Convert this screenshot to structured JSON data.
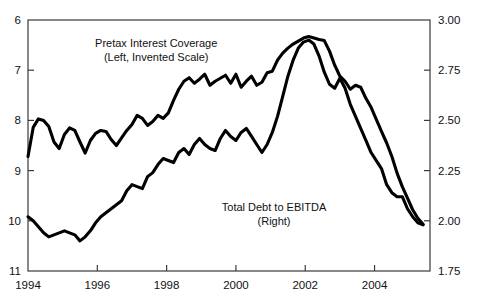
{
  "chart_data": {
    "type": "line",
    "title": "",
    "subtitle": "",
    "xlabel": "",
    "ylabel": "",
    "grid": false,
    "legend_position": "inline-annotations",
    "xlim": [
      1994.0,
      2005.6
    ],
    "x_ticks": [
      1994,
      1996,
      1998,
      2000,
      2002,
      2004
    ],
    "x_tick_labels": [
      "1994",
      "1996",
      "1998",
      "2000",
      "2002",
      "2004"
    ],
    "left_axis": {
      "label": "Pretax Interest Coverage (Left, Invented Scale)",
      "ylim": [
        11,
        6
      ],
      "inverted": true,
      "ticks": [
        6,
        7,
        8,
        9,
        10,
        11
      ],
      "tick_labels": [
        "6",
        "7",
        "8",
        "9",
        "10",
        "11"
      ]
    },
    "right_axis": {
      "label": "Total Debt to EBITDA (Right)",
      "ylim": [
        1.75,
        3.0
      ],
      "inverted": false,
      "ticks": [
        1.75,
        2.0,
        2.25,
        2.5,
        2.75,
        3.0
      ],
      "tick_labels": [
        "1.75",
        "2.00",
        "2.25",
        "2.50",
        "2.75",
        "3.00"
      ]
    },
    "annotations": [
      {
        "name": "pretax-interest-coverage-label",
        "lines": [
          "Pretax Interest Coverage",
          "(Left, Invented Scale)"
        ],
        "x": 1997.7,
        "y_px": 47
      },
      {
        "name": "total-debt-to-ebitda-label",
        "lines": [
          "Total Debt to EBITDA",
          "(Right)"
        ],
        "x": 2001.1,
        "y_px": 211
      }
    ],
    "series": [
      {
        "name": "Pretax Interest Coverage",
        "axis": "left",
        "color": "#000000",
        "x": [
          1994.0,
          1994.15,
          1994.3,
          1994.45,
          1994.6,
          1994.75,
          1994.9,
          1995.05,
          1995.2,
          1995.35,
          1995.5,
          1995.65,
          1995.8,
          1995.95,
          1996.1,
          1996.25,
          1996.4,
          1996.55,
          1996.7,
          1996.85,
          1997.0,
          1997.15,
          1997.3,
          1997.45,
          1997.6,
          1997.75,
          1997.9,
          1998.05,
          1998.2,
          1998.35,
          1998.5,
          1998.65,
          1998.8,
          1998.95,
          1999.1,
          1999.25,
          1999.4,
          1999.55,
          1999.7,
          1999.85,
          2000.0,
          2000.15,
          2000.3,
          2000.45,
          2000.6,
          2000.75,
          2000.9,
          2001.05,
          2001.2,
          2001.35,
          2001.5,
          2001.65,
          2001.8,
          2001.95,
          2002.1,
          2002.25,
          2002.4,
          2002.55,
          2002.7,
          2002.85,
          2003.0,
          2003.15,
          2003.3,
          2003.45,
          2003.6,
          2003.75,
          2003.9,
          2004.05,
          2004.2,
          2004.35,
          2004.5,
          2004.65,
          2004.8,
          2004.95,
          2005.1,
          2005.25,
          2005.4
        ],
        "y": [
          8.72,
          8.14,
          7.97,
          8.0,
          8.12,
          8.43,
          8.56,
          8.28,
          8.15,
          8.2,
          8.43,
          8.65,
          8.4,
          8.26,
          8.2,
          8.22,
          8.38,
          8.5,
          8.35,
          8.2,
          8.08,
          7.9,
          7.96,
          8.1,
          8.02,
          7.9,
          7.96,
          7.85,
          7.6,
          7.38,
          7.22,
          7.15,
          7.26,
          7.18,
          7.08,
          7.3,
          7.22,
          7.16,
          7.1,
          7.26,
          7.08,
          7.34,
          7.22,
          7.12,
          7.3,
          7.24,
          7.05,
          7.02,
          6.8,
          6.66,
          6.56,
          6.48,
          6.42,
          6.36,
          6.33,
          6.36,
          6.39,
          6.41,
          6.62,
          6.9,
          7.12,
          7.22,
          7.38,
          7.3,
          7.34,
          7.56,
          7.74,
          7.98,
          8.22,
          8.45,
          8.72,
          9.05,
          9.32,
          9.55,
          9.78,
          9.95,
          10.07
        ]
      },
      {
        "name": "Total Debt to EBITDA",
        "axis": "right",
        "color": "#000000",
        "x": [
          1994.0,
          1994.15,
          1994.3,
          1994.45,
          1994.6,
          1994.75,
          1994.9,
          1995.05,
          1995.2,
          1995.35,
          1995.5,
          1995.65,
          1995.8,
          1995.95,
          1996.1,
          1996.25,
          1996.4,
          1996.55,
          1996.7,
          1996.85,
          1997.0,
          1997.15,
          1997.3,
          1997.45,
          1997.6,
          1997.75,
          1997.9,
          1998.05,
          1998.2,
          1998.35,
          1998.5,
          1998.65,
          1998.8,
          1998.95,
          1999.1,
          1999.25,
          1999.4,
          1999.55,
          1999.7,
          1999.85,
          2000.0,
          2000.15,
          2000.3,
          2000.45,
          2000.6,
          2000.75,
          2000.9,
          2001.05,
          2001.2,
          2001.35,
          2001.5,
          2001.65,
          2001.8,
          2001.95,
          2002.1,
          2002.25,
          2002.4,
          2002.55,
          2002.7,
          2002.85,
          2003.0,
          2003.15,
          2003.3,
          2003.45,
          2003.6,
          2003.75,
          2003.9,
          2004.05,
          2004.2,
          2004.35,
          2004.5,
          2004.65,
          2004.8,
          2004.95,
          2005.1,
          2005.25,
          2005.4
        ],
        "y": [
          2.02,
          2.0,
          1.97,
          1.94,
          1.92,
          1.93,
          1.94,
          1.95,
          1.94,
          1.93,
          1.9,
          1.92,
          1.95,
          1.99,
          2.02,
          2.04,
          2.06,
          2.08,
          2.1,
          2.15,
          2.18,
          2.17,
          2.16,
          2.22,
          2.24,
          2.28,
          2.31,
          2.3,
          2.29,
          2.34,
          2.36,
          2.33,
          2.38,
          2.41,
          2.38,
          2.36,
          2.35,
          2.41,
          2.45,
          2.42,
          2.4,
          2.44,
          2.46,
          2.42,
          2.38,
          2.34,
          2.38,
          2.44,
          2.52,
          2.62,
          2.72,
          2.8,
          2.86,
          2.89,
          2.9,
          2.88,
          2.82,
          2.74,
          2.68,
          2.66,
          2.71,
          2.66,
          2.58,
          2.52,
          2.46,
          2.4,
          2.34,
          2.3,
          2.26,
          2.18,
          2.14,
          2.12,
          2.12,
          2.06,
          2.02,
          1.99,
          1.98
        ]
      }
    ]
  }
}
